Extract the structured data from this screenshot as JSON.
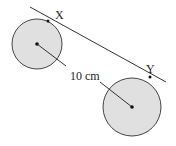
{
  "diagram": {
    "circles": [
      {
        "id": "left",
        "cx": 37,
        "cy": 44,
        "r": 25,
        "fill": "#e0e0e0",
        "stroke": "#444"
      },
      {
        "id": "right",
        "cx": 132,
        "cy": 107,
        "r": 29,
        "fill": "#e0e0e0",
        "stroke": "#444"
      }
    ],
    "tangent_line": {
      "x1": 30,
      "y1": 7,
      "x2": 166,
      "y2": 82
    },
    "points": [
      {
        "label": "X",
        "x": 48,
        "y": 21,
        "label_x": 53,
        "label_y": 19
      },
      {
        "label": "Y",
        "x": 148,
        "y": 76,
        "label_x": 148,
        "label_y": 74
      }
    ],
    "centre_distance_label": "10 cm",
    "colors": {
      "fill": "#e0e0e0",
      "stroke": "#444444",
      "line": "#333333"
    }
  }
}
